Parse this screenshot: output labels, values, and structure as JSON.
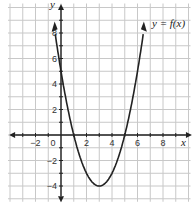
{
  "chart_data": {
    "type": "line",
    "title": "",
    "function_label": "y = f(x)",
    "xlabel": "x",
    "ylabel": "y",
    "xlim": [
      -4,
      10
    ],
    "ylim": [
      -5,
      10
    ],
    "grid": true,
    "x_ticks": [
      -2,
      0,
      2,
      4,
      6,
      8
    ],
    "y_ticks": [
      8,
      6,
      4,
      2,
      -2,
      -4
    ],
    "series": [
      {
        "name": "f(x)",
        "equation": "x^2 - 6x + 5",
        "vertex": [
          3,
          -4
        ],
        "roots": [
          1,
          5
        ],
        "y_intercept": 5,
        "x": [
          -0.5,
          0,
          1,
          2,
          3,
          4,
          5,
          6,
          6.5
        ],
        "values": [
          8.25,
          5,
          0,
          -3,
          -4,
          -3,
          0,
          5,
          8.25
        ]
      }
    ]
  },
  "colors": {
    "grid": "#c8c8c8",
    "axis": "#222222",
    "curve": "#222222"
  }
}
